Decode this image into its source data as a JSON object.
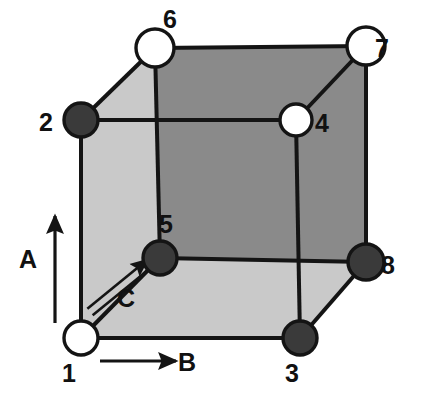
{
  "figure": {
    "background_color": "#ffffff",
    "edge_color": "#141414",
    "face_light_color": "#c9c9c9",
    "face_dark_color": "#8a8a8a",
    "node_filled_color": "#3a3a3a",
    "node_open_color": "#ffffff"
  },
  "nodes": [
    {
      "id": "1",
      "label": "1",
      "x": 81,
      "y": 338,
      "r": 17,
      "fill": "open",
      "label_x": 69,
      "label_y": 382
    },
    {
      "id": "2",
      "label": "2",
      "x": 81,
      "y": 120,
      "r": 17,
      "fill": "filled",
      "label_x": 46,
      "label_y": 131
    },
    {
      "id": "3",
      "label": "3",
      "x": 300,
      "y": 338,
      "r": 17,
      "fill": "filled",
      "label_x": 292,
      "label_y": 382
    },
    {
      "id": "4",
      "label": "4",
      "x": 296,
      "y": 120,
      "r": 16,
      "fill": "open",
      "label_x": 322,
      "label_y": 132
    },
    {
      "id": "5",
      "label": "5",
      "x": 160,
      "y": 258,
      "r": 17,
      "fill": "filled",
      "label_x": 166,
      "label_y": 233
    },
    {
      "id": "6",
      "label": "6",
      "x": 155,
      "y": 48,
      "r": 19,
      "fill": "open",
      "label_x": 170,
      "label_y": 28
    },
    {
      "id": "7",
      "label": "7",
      "x": 366,
      "y": 46,
      "r": 19,
      "fill": "open",
      "label_x": 382,
      "label_y": 57
    },
    {
      "id": "8",
      "label": "8",
      "x": 366,
      "y": 262,
      "r": 18,
      "fill": "filled",
      "label_x": 388,
      "label_y": 274
    }
  ],
  "faces": [
    {
      "name": "back-face",
      "shade": "dark",
      "points": "155,48 366,46 366,262 160,258"
    },
    {
      "name": "left-face",
      "shade": "light",
      "points": "81,120 155,48 160,258 81,338"
    },
    {
      "name": "bottom-face",
      "shade": "light",
      "points": "81,338 160,258 366,262 300,338"
    }
  ],
  "edges": [
    {
      "name": "edge-1-2",
      "x1": 81,
      "y1": 338,
      "x2": 81,
      "y2": 120
    },
    {
      "name": "edge-1-3",
      "x1": 81,
      "y1": 338,
      "x2": 300,
      "y2": 338
    },
    {
      "name": "edge-1-5",
      "x1": 81,
      "y1": 338,
      "x2": 160,
      "y2": 258
    },
    {
      "name": "edge-2-4",
      "x1": 81,
      "y1": 120,
      "x2": 296,
      "y2": 120
    },
    {
      "name": "edge-2-6",
      "x1": 81,
      "y1": 120,
      "x2": 155,
      "y2": 48
    },
    {
      "name": "edge-3-4",
      "x1": 300,
      "y1": 338,
      "x2": 296,
      "y2": 120
    },
    {
      "name": "edge-3-8",
      "x1": 300,
      "y1": 338,
      "x2": 366,
      "y2": 262
    },
    {
      "name": "edge-4-7",
      "x1": 296,
      "y1": 120,
      "x2": 366,
      "y2": 46
    },
    {
      "name": "edge-5-6",
      "x1": 160,
      "y1": 258,
      "x2": 155,
      "y2": 48
    },
    {
      "name": "edge-5-8",
      "x1": 160,
      "y1": 258,
      "x2": 366,
      "y2": 262
    },
    {
      "name": "edge-6-7",
      "x1": 155,
      "y1": 48,
      "x2": 366,
      "y2": 46
    },
    {
      "name": "edge-7-8",
      "x1": 366,
      "y1": 46,
      "x2": 366,
      "y2": 262
    }
  ],
  "axes": [
    {
      "id": "A",
      "label": "A",
      "style": "single-line",
      "x1": 55,
      "y1": 323,
      "x2": 55,
      "y2": 216,
      "label_x": 28,
      "label_y": 268
    },
    {
      "id": "B",
      "label": "B",
      "style": "single-line",
      "x1": 100,
      "y1": 361,
      "x2": 176,
      "y2": 361,
      "label_x": 187,
      "label_y": 371
    },
    {
      "id": "C",
      "label": "C",
      "style": "double-line",
      "x1": 90,
      "y1": 312,
      "x2": 150,
      "y2": 263,
      "label_x": 126,
      "label_y": 307
    }
  ]
}
